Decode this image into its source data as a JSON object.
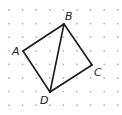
{
  "diagram": {
    "type": "quadrilateral-on-dot-grid",
    "grid": {
      "x0": 9,
      "y0": 10,
      "spacing": 13.6,
      "cols": 9,
      "rows": 8,
      "dot_color": "#b8b8b8",
      "dot_radius": 0.9
    },
    "stroke_color": "#1a1a1a",
    "vertices": {
      "A": {
        "label": "A",
        "x": 23,
        "y": 51,
        "lx": 12,
        "ly": 55
      },
      "B": {
        "label": "B",
        "x": 64,
        "y": 24,
        "lx": 65,
        "ly": 20
      },
      "C": {
        "label": "C",
        "x": 92,
        "y": 65,
        "lx": 94,
        "ly": 76
      },
      "D": {
        "label": "D",
        "x": 50,
        "y": 92,
        "lx": 40,
        "ly": 104
      }
    },
    "segments": [
      [
        "A",
        "B"
      ],
      [
        "B",
        "C"
      ],
      [
        "C",
        "D"
      ],
      [
        "D",
        "A"
      ],
      [
        "B",
        "D"
      ]
    ]
  }
}
